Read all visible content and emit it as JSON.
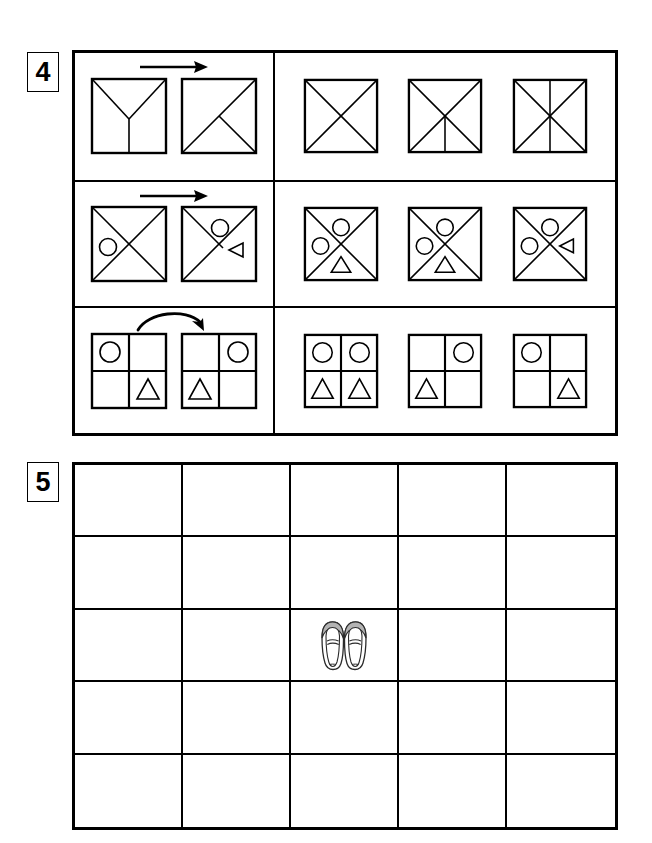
{
  "page": {
    "background_color": "#ffffff",
    "ink_color": "#000000",
    "shoe_shade_color": "#b3b3b3"
  },
  "sections": [
    {
      "number": "4",
      "name": "analogy-puzzle",
      "rows": [
        {
          "name": "row-1-lines",
          "arrow": "straight-right-arrow",
          "prompt": [
            {
              "name": "square-y-lines",
              "shape": "square",
              "marks": [
                "diagonal-top-left-to-center",
                "diagonal-top-right-to-center",
                "vertical-center-to-bottom"
              ],
              "items": []
            },
            {
              "name": "square-diag-plus-half",
              "shape": "square",
              "marks": [
                "diagonal-bottom-left-to-top-right",
                "diagonal-bottom-right-to-center"
              ],
              "items": []
            }
          ],
          "options": [
            {
              "name": "option-a",
              "shape": "square",
              "marks": [
                "diagonal-bottom-left-to-top-right",
                "diagonal-top-left-to-bottom-right"
              ],
              "items": []
            },
            {
              "name": "option-b",
              "shape": "square",
              "marks": [
                "diagonal-bottom-left-to-top-right",
                "diagonal-top-left-to-bottom-right",
                "vertical-center-to-bottom"
              ],
              "items": []
            },
            {
              "name": "option-c",
              "shape": "square",
              "marks": [
                "diagonal-bottom-left-to-top-right",
                "diagonal-top-left-to-bottom-right",
                "vertical-full"
              ],
              "items": []
            }
          ]
        },
        {
          "name": "row-2-shapes-in-x",
          "arrow": "straight-right-arrow",
          "prompt": [
            {
              "name": "square-x-circle-left",
              "shape": "square",
              "marks": [
                "diagonal-bottom-left-to-top-right",
                "diagonal-top-left-to-bottom-right"
              ],
              "items": [
                {
                  "glyph": "circle",
                  "sector": "left"
                }
              ]
            },
            {
              "name": "square-halfx-circle-top-triangle-right",
              "shape": "square",
              "marks": [
                "diagonal-bottom-left-to-top-right",
                "diagonal-top-left-to-center"
              ],
              "items": [
                {
                  "glyph": "circle",
                  "sector": "top"
                },
                {
                  "glyph": "triangle-left",
                  "sector": "right"
                }
              ]
            }
          ],
          "options": [
            {
              "name": "option-a",
              "shape": "square",
              "marks": [
                "diagonal-bottom-left-to-top-right",
                "diagonal-top-left-to-bottom-right"
              ],
              "items": [
                {
                  "glyph": "circle",
                  "sector": "top"
                },
                {
                  "glyph": "circle",
                  "sector": "left"
                },
                {
                  "glyph": "triangle-up",
                  "sector": "bottom"
                }
              ]
            },
            {
              "name": "option-b",
              "shape": "square",
              "marks": [
                "diagonal-bottom-left-to-top-right",
                "diagonal-top-left-to-bottom-right"
              ],
              "items": [
                {
                  "glyph": "circle",
                  "sector": "top"
                },
                {
                  "glyph": "circle",
                  "sector": "left"
                },
                {
                  "glyph": "triangle-up",
                  "sector": "bottom"
                }
              ]
            },
            {
              "name": "option-c",
              "shape": "square",
              "marks": [
                "diagonal-bottom-left-to-top-right",
                "diagonal-top-left-to-bottom-right"
              ],
              "items": [
                {
                  "glyph": "circle",
                  "sector": "top"
                },
                {
                  "glyph": "circle",
                  "sector": "left"
                },
                {
                  "glyph": "triangle-left",
                  "sector": "right"
                }
              ]
            }
          ]
        },
        {
          "name": "row-3-quadrants",
          "arrow": "curved-right-arrow",
          "prompt": [
            {
              "name": "quad-circle-tl-triangle-br",
              "shape": "quad-grid",
              "cells": [
                "circle",
                "",
                "",
                "triangle-up"
              ]
            },
            {
              "name": "quad-circle-tr-triangle-bl",
              "shape": "quad-grid",
              "cells": [
                "",
                "circle",
                "triangle-up",
                ""
              ]
            }
          ],
          "options": [
            {
              "name": "option-a",
              "shape": "quad-grid",
              "cells": [
                "circle",
                "circle",
                "triangle-up",
                "triangle-up"
              ]
            },
            {
              "name": "option-b",
              "shape": "quad-grid",
              "cells": [
                "",
                "circle",
                "triangle-up",
                ""
              ]
            },
            {
              "name": "option-c",
              "shape": "quad-grid",
              "cells": [
                "circle",
                "",
                "",
                "triangle-up"
              ]
            }
          ]
        }
      ]
    },
    {
      "number": "5",
      "name": "empty-answer-grid",
      "grid": {
        "columns": 5,
        "rows": 5,
        "cells": [
          "",
          "",
          "",
          "",
          "",
          "",
          "",
          "",
          "",
          "",
          "",
          "",
          "shoes",
          "",
          "",
          "",
          "",
          "",
          "",
          "",
          "",
          "",
          "",
          "",
          ""
        ],
        "icon_label": "pair-of-shoes"
      }
    }
  ]
}
